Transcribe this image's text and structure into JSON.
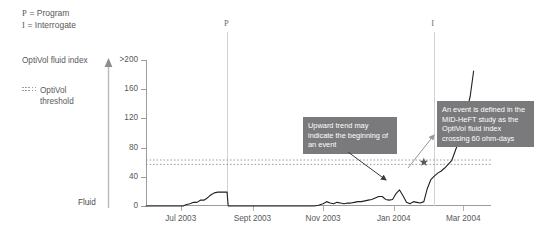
{
  "key_legend": [
    {
      "symbol": "P",
      "text": "= Program"
    },
    {
      "symbol": "I",
      "text": "= Interrogate"
    }
  ],
  "labels": {
    "y_axis_title": "OptiVol fluid index",
    "threshold_legend_line1": "OptiVol",
    "threshold_legend_line2": "threshold",
    "fluid_arrow_label": "Fluid"
  },
  "annotations": [
    {
      "id": "upward-trend",
      "text": "Upward trend may indicate the beginning of an event"
    },
    {
      "id": "event-definition",
      "text": "An event is defined in the MID-HeFT study as the OptiVol fluid index crossing 60 ohm-days"
    }
  ],
  "markers": [
    {
      "label": "P",
      "name": "program-marker",
      "x_value": "2003-08-10"
    },
    {
      "label": "I",
      "name": "interrogate-marker",
      "x_value": "2004-02-05"
    }
  ],
  "colors": {
    "curve": "#231f20",
    "axis": "#9b9b9d",
    "threshold": "#9aa0a6",
    "callout_bg": "#7a7a7c",
    "callout_text": "#ffffff",
    "marker_line": "#d2d2d4",
    "text": "#58585a",
    "arrow": "#b9b9bb"
  },
  "chart_data": {
    "type": "line",
    "title": "",
    "subtitle": "",
    "xlabel": "",
    "ylabel": "OptiVol fluid index",
    "ylim": [
      0,
      200
    ],
    "xlim": [
      "2003-06-01",
      "2004-03-25"
    ],
    "grid": false,
    "legend_position": "left",
    "y_ticks": [
      0,
      40,
      80,
      120,
      160,
      200
    ],
    "y_tick_labels": [
      "0",
      "40",
      "80",
      "120",
      "160",
      ">200"
    ],
    "x_ticks": [
      "2003-07-01",
      "2003-09-01",
      "2003-11-01",
      "2004-01-01",
      "2004-03-01"
    ],
    "x_tick_labels": [
      "Jul 2003",
      "Sept 2003",
      "Nov 2003",
      "Jan 2004",
      "Mar 2004"
    ],
    "threshold": {
      "value": 60,
      "label": "OptiVol threshold",
      "style": "dotted",
      "units": "ohm-days"
    },
    "event_marker": {
      "type": "star",
      "x": "2004-01-27",
      "y": 60,
      "label": "threshold crossing"
    },
    "series": [
      {
        "name": "OptiVol fluid index",
        "units": "ohm-days",
        "x": [
          "2003-06-01",
          "2003-06-08",
          "2003-06-15",
          "2003-06-22",
          "2003-06-29",
          "2003-07-03",
          "2003-07-06",
          "2003-07-09",
          "2003-07-12",
          "2003-07-15",
          "2003-07-18",
          "2003-07-21",
          "2003-07-24",
          "2003-07-26",
          "2003-07-28",
          "2003-07-30",
          "2003-08-02",
          "2003-08-05",
          "2003-08-08",
          "2003-08-10",
          "2003-08-11",
          "2003-08-20",
          "2003-09-01",
          "2003-09-15",
          "2003-10-01",
          "2003-10-10",
          "2003-10-18",
          "2003-10-24",
          "2003-10-28",
          "2003-11-01",
          "2003-11-04",
          "2003-11-07",
          "2003-11-10",
          "2003-11-13",
          "2003-11-16",
          "2003-11-19",
          "2003-11-22",
          "2003-11-25",
          "2003-11-28",
          "2003-12-01",
          "2003-12-04",
          "2003-12-07",
          "2003-12-10",
          "2003-12-13",
          "2003-12-16",
          "2003-12-19",
          "2003-12-22",
          "2003-12-25",
          "2003-12-28",
          "2003-12-31",
          "2004-01-03",
          "2004-01-06",
          "2004-01-09",
          "2004-01-12",
          "2004-01-15",
          "2004-01-18",
          "2004-01-21",
          "2004-01-24",
          "2004-01-27",
          "2004-01-30",
          "2004-02-02",
          "2004-02-05",
          "2004-02-08",
          "2004-02-11",
          "2004-02-14",
          "2004-02-17",
          "2004-02-20",
          "2004-02-23",
          "2004-02-26",
          "2004-03-01",
          "2004-03-04",
          "2004-03-07",
          "2004-03-10"
        ],
        "y": [
          0,
          0,
          0,
          0,
          0,
          0,
          2,
          3,
          5,
          5,
          8,
          8,
          11,
          14,
          16,
          18,
          19,
          19,
          19,
          19,
          0,
          0,
          0,
          0,
          0,
          0,
          0,
          0,
          1,
          3,
          6,
          4,
          3,
          5,
          4,
          3,
          4,
          4,
          5,
          6,
          6,
          7,
          8,
          9,
          11,
          13,
          13,
          9,
          8,
          9,
          17,
          22,
          14,
          5,
          3,
          6,
          5,
          4,
          6,
          24,
          36,
          41,
          45,
          48,
          52,
          57,
          62,
          75,
          88,
          100,
          130,
          150,
          185
        ],
        "color": "#231f20"
      }
    ]
  }
}
